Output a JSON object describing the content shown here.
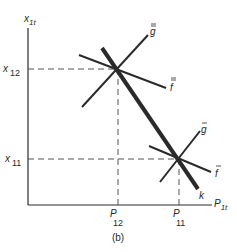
{
  "figure": {
    "caption": "(b)",
    "axes": {
      "y_label": "x",
      "y_label_sub": "1t",
      "x_label": "P",
      "x_label_sub": "1t"
    },
    "ticks": {
      "y": [
        {
          "label": "x",
          "sub": "12"
        },
        {
          "label": "x",
          "sub": "11"
        }
      ],
      "x": [
        {
          "label": "P",
          "sub": "12"
        },
        {
          "label": "P",
          "sub": "11"
        }
      ]
    },
    "lines": {
      "k": {
        "label": "k",
        "style": "thick"
      },
      "g_double_bar": {
        "label": "g",
        "accent": "="
      },
      "f_double_bar": {
        "label": "f",
        "accent": "="
      },
      "g_bar": {
        "label": "g",
        "accent": "-"
      },
      "f_bar": {
        "label": "f",
        "accent": "-"
      }
    },
    "colors": {
      "line": "#2a2a2a",
      "dashed": "#555555",
      "background": "#ffffff"
    }
  }
}
